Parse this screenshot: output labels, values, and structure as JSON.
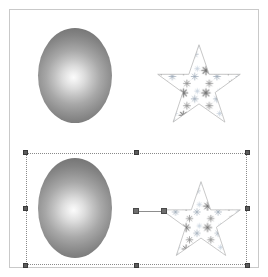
{
  "app": {
    "title": "Vector Drawing Canvas",
    "background_color": "#ffffff",
    "frame_border_color": "#c9c9c9"
  },
  "canvas": {
    "label": "artboard",
    "width_px": 250,
    "height_px": 259
  },
  "objects": [
    {
      "id": "ellipse-top",
      "name": "ellipse-unselected",
      "shape": "ellipse",
      "fill_type": "radial-gradient",
      "fill_center_color": "#fbfbfb",
      "fill_edge_color": "#666666",
      "stroke": "none",
      "selected": false
    },
    {
      "id": "star-top",
      "name": "star-unselected",
      "shape": "star-5-point",
      "fill_type": "pattern",
      "pattern_name": "snowflake-pattern",
      "stroke_color": "#b6b6b6",
      "selected": false
    },
    {
      "id": "ellipse-bottom",
      "name": "ellipse-selected",
      "shape": "ellipse",
      "fill_type": "radial-gradient",
      "fill_center_color": "#fbfbfb",
      "fill_edge_color": "#666666",
      "stroke": "none",
      "selected": true
    },
    {
      "id": "star-bottom",
      "name": "star-selected",
      "shape": "star-5-point",
      "fill_type": "pattern",
      "pattern_name": "snowflake-pattern",
      "stroke_color": "#b6b6b6",
      "selected": true
    }
  ],
  "selection": {
    "label": "selection-bounding-box",
    "border_style": "dotted",
    "border_color": "#8a8a8a",
    "handle_color": "#5c5c5c",
    "handle_count": 8,
    "handles": [
      "top-left",
      "top-center",
      "top-right",
      "middle-left",
      "middle-right",
      "bottom-left",
      "bottom-center",
      "bottom-right"
    ]
  },
  "gradient_control": {
    "label": "gradient-direction-line",
    "line_color": "#8d8d8d",
    "handle_color": "#6e6e6e",
    "start_handle": "gradient-start-handle",
    "end_handle": "gradient-end-handle"
  },
  "pattern": {
    "name": "snowflake-pattern",
    "glyph_colors": [
      "#6f6f6f",
      "#8e8e8e",
      "#a9b4c2",
      "#c3cfdc",
      "#9aa7b5"
    ],
    "glyph_shape": "six-point-asterisk"
  }
}
